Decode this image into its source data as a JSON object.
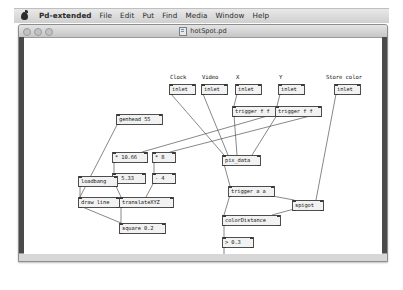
{
  "menubar": {
    "apple_icon": "apple-logo-icon",
    "items": [
      {
        "label": "Pd-extended",
        "app": true
      },
      {
        "label": "File"
      },
      {
        "label": "Edit"
      },
      {
        "label": "Put"
      },
      {
        "label": "Find"
      },
      {
        "label": "Media"
      },
      {
        "label": "Window"
      },
      {
        "label": "Help"
      }
    ]
  },
  "window": {
    "title": "hotSpot.pd",
    "doc_icon": "pd-document-icon",
    "lights": [
      "close-button",
      "minimize-button",
      "zoom-button"
    ]
  },
  "canvas": {
    "comments": [
      {
        "id": "comment-clock",
        "text": "Clock",
        "x": 146,
        "y": 36
      },
      {
        "id": "comment-video",
        "text": "Video",
        "x": 178,
        "y": 36
      },
      {
        "id": "comment-x",
        "text": "X",
        "x": 212,
        "y": 36
      },
      {
        "id": "comment-y",
        "text": "Y",
        "x": 255,
        "y": 36
      },
      {
        "id": "comment-store-color",
        "text": "Store color",
        "x": 302,
        "y": 36
      }
    ],
    "objects": [
      {
        "id": "inlet-clock",
        "text": "inlet",
        "x": 145,
        "y": 46,
        "w": 21
      },
      {
        "id": "inlet-video",
        "text": "inlet",
        "x": 177,
        "y": 46,
        "w": 21
      },
      {
        "id": "inlet-x",
        "text": "inlet",
        "x": 211,
        "y": 46,
        "w": 21
      },
      {
        "id": "inlet-y",
        "text": "inlet",
        "x": 254,
        "y": 46,
        "w": 21
      },
      {
        "id": "inlet-store-color",
        "text": "inlet",
        "x": 310,
        "y": 46,
        "w": 21
      },
      {
        "id": "trigger-f-f-x",
        "text": "trigger f f",
        "x": 208,
        "y": 68,
        "w": 41
      },
      {
        "id": "trigger-f-f-y",
        "text": "trigger f f",
        "x": 251,
        "y": 68,
        "w": 41
      },
      {
        "id": "genhead-55",
        "text": "genhead 55",
        "x": 92,
        "y": 76,
        "w": 41
      },
      {
        "id": "multiply-10-66",
        "text": "* 10.66",
        "x": 88,
        "y": 114,
        "w": 30
      },
      {
        "id": "multiply-8",
        "text": "* 8",
        "x": 128,
        "y": 114,
        "w": 18
      },
      {
        "id": "subtract-5-33",
        "text": "- 5.33",
        "x": 88,
        "y": 135,
        "w": 28
      },
      {
        "id": "subtract-4",
        "text": "- 4",
        "x": 128,
        "y": 135,
        "w": 18
      },
      {
        "id": "pix-data",
        "text": "pix_data",
        "x": 198,
        "y": 117,
        "w": 33
      },
      {
        "id": "loadbang",
        "text": "loadbang",
        "x": 54,
        "y": 138,
        "w": 34
      },
      {
        "id": "draw-line",
        "text": "draw line",
        "x": 54,
        "y": 159,
        "w": 36
      },
      {
        "id": "translate-xyz",
        "text": "translateXYZ",
        "x": 95,
        "y": 159,
        "w": 49
      },
      {
        "id": "trigger-a-a",
        "text": "trigger a a",
        "x": 204,
        "y": 148,
        "w": 41
      },
      {
        "id": "spigot",
        "text": "spigot",
        "x": 268,
        "y": 162,
        "w": 26
      },
      {
        "id": "square-0-2",
        "text": "square 0.2",
        "x": 95,
        "y": 185,
        "w": 41
      },
      {
        "id": "color-distance",
        "text": "colorDistance",
        "x": 198,
        "y": 177,
        "w": 53
      },
      {
        "id": "greater-0-3",
        "text": "> 0.3",
        "x": 198,
        "y": 199,
        "w": 26
      },
      {
        "id": "change",
        "text": "change",
        "x": 198,
        "y": 220,
        "w": 29
      },
      {
        "id": "outlet",
        "text": "outlet",
        "x": 198,
        "y": 240,
        "w": 26
      }
    ],
    "connections": [
      {
        "from": "inlet-clock",
        "to": "pix-data",
        "x1": 147,
        "y1": 56,
        "x2": 200,
        "y2": 117
      },
      {
        "from": "inlet-video",
        "to": "pix-data",
        "x1": 179,
        "y1": 56,
        "x2": 204,
        "y2": 117
      },
      {
        "from": "inlet-x",
        "to": "trigger-f-f-x",
        "x1": 213,
        "y1": 56,
        "x2": 210,
        "y2": 68
      },
      {
        "from": "inlet-y",
        "to": "trigger-f-f-y",
        "x1": 256,
        "y1": 56,
        "x2": 253,
        "y2": 68
      },
      {
        "from": "trigger-f-f-x-l",
        "to": "pix-data-mid",
        "x1": 210,
        "y1": 77,
        "x2": 213,
        "y2": 117
      },
      {
        "from": "trigger-f-f-x-r",
        "to": "multiply-10-66",
        "x1": 247,
        "y1": 77,
        "x2": 118,
        "y2": 114
      },
      {
        "from": "trigger-f-f-y-l",
        "to": "pix-data-right",
        "x1": 253,
        "y1": 77,
        "x2": 228,
        "y2": 117
      },
      {
        "from": "trigger-f-f-y-r",
        "to": "multiply-8",
        "x1": 290,
        "y1": 77,
        "x2": 146,
        "y2": 114
      },
      {
        "from": "inlet-store-color",
        "to": "spigot",
        "x1": 312,
        "y1": 56,
        "x2": 292,
        "y2": 162
      },
      {
        "from": "multiply-10-66",
        "to": "subtract-5-33",
        "x1": 90,
        "y1": 123,
        "x2": 90,
        "y2": 135
      },
      {
        "from": "multiply-8",
        "to": "subtract-4",
        "x1": 130,
        "y1": 123,
        "x2": 130,
        "y2": 135
      },
      {
        "from": "subtract-5-33",
        "to": "translate-xyz",
        "x1": 90,
        "y1": 144,
        "x2": 97,
        "y2": 159
      },
      {
        "from": "subtract-4",
        "to": "translate-xyz",
        "x1": 130,
        "y1": 144,
        "x2": 122,
        "y2": 159
      },
      {
        "from": "genhead-55",
        "to": "draw-line",
        "x1": 94,
        "y1": 85,
        "x2": 56,
        "y2": 159
      },
      {
        "from": "loadbang",
        "to": "draw-line",
        "x1": 56,
        "y1": 147,
        "x2": 56,
        "y2": 159
      },
      {
        "from": "draw-line",
        "to": "square-0-2",
        "x1": 56,
        "y1": 168,
        "x2": 97,
        "y2": 185
      },
      {
        "from": "translate-xyz",
        "to": "square-0-2",
        "x1": 97,
        "y1": 168,
        "x2": 97,
        "y2": 185
      },
      {
        "from": "pix-data",
        "to": "trigger-a-a",
        "x1": 200,
        "y1": 126,
        "x2": 206,
        "y2": 148
      },
      {
        "from": "trigger-a-a-l",
        "to": "color-distance",
        "x1": 206,
        "y1": 157,
        "x2": 200,
        "y2": 177
      },
      {
        "from": "trigger-a-a-r",
        "to": "spigot",
        "x1": 243,
        "y1": 157,
        "x2": 270,
        "y2": 162
      },
      {
        "from": "spigot",
        "to": "color-distance",
        "x1": 270,
        "y1": 171,
        "x2": 248,
        "y2": 177
      },
      {
        "from": "color-distance",
        "to": "greater-0-3",
        "x1": 200,
        "y1": 186,
        "x2": 200,
        "y2": 199
      },
      {
        "from": "greater-0-3",
        "to": "change",
        "x1": 200,
        "y1": 208,
        "x2": 200,
        "y2": 220
      },
      {
        "from": "change",
        "to": "outlet",
        "x1": 200,
        "y1": 229,
        "x2": 200,
        "y2": 240
      }
    ]
  },
  "colors": {
    "canvas_bg": "#ffffff",
    "object_fill": "#f2f2f2",
    "object_border": "#4d4d4d",
    "wire": "#555555",
    "window_chrome": "#d7d7d7",
    "rail": "#4a4a4a"
  }
}
